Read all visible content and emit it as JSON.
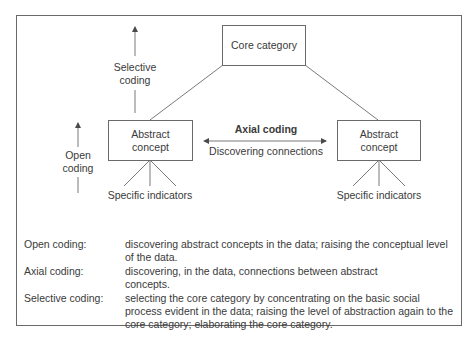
{
  "diagram": {
    "core_category": "Core category",
    "abstract_concept_left": "Abstract concept",
    "abstract_concept_right": "Abstract concept",
    "selective_coding_label": [
      "Selective",
      "coding"
    ],
    "open_coding_label": [
      "Open",
      "coding"
    ],
    "axial_coding_title": "Axial coding",
    "axial_coding_subtitle": "Discovering connections",
    "specific_indicators_left": "Specific indicators",
    "specific_indicators_right": "Specific indicators"
  },
  "definitions": [
    {
      "term": "Open coding:",
      "description": "discovering abstract concepts in the data; raising the conceptual level of the data."
    },
    {
      "term": "Axial coding:",
      "description": "discovering, in the data, connections between abstract concepts."
    },
    {
      "term": "Selective coding:",
      "description": "selecting the core category by concentrating on the basic social process evident in the data; raising the level of abstraction again to the core category; elaborating the core category."
    }
  ],
  "colors": {
    "line": "#6a6a6a",
    "text": "#3a3a3a",
    "background": "#ffffff"
  }
}
